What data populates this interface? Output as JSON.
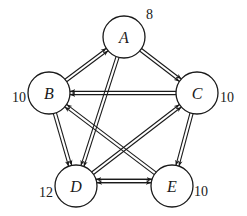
{
  "diagram": {
    "type": "directed-graph",
    "colors": {
      "stroke": "#1a1a1a",
      "background": "#ffffff"
    },
    "nodes": [
      {
        "id": "A",
        "label": "A",
        "weight": "8",
        "cx": 124,
        "cy": 37,
        "r": 21,
        "wx": 146,
        "wy": 14,
        "anchor": "start"
      },
      {
        "id": "B",
        "label": "B",
        "weight": "10",
        "cx": 49,
        "cy": 93,
        "r": 21,
        "wx": 26,
        "wy": 97,
        "anchor": "end"
      },
      {
        "id": "C",
        "label": "C",
        "weight": "10",
        "cx": 197,
        "cy": 93,
        "r": 21,
        "wx": 220,
        "wy": 97,
        "anchor": "start"
      },
      {
        "id": "D",
        "label": "D",
        "weight": "12",
        "cx": 76,
        "cy": 186,
        "r": 21,
        "wx": 53,
        "wy": 192,
        "anchor": "end"
      },
      {
        "id": "E",
        "label": "E",
        "weight": "10",
        "cx": 172,
        "cy": 186,
        "r": 21,
        "wx": 194,
        "wy": 191,
        "anchor": "start"
      }
    ],
    "edges": [
      {
        "from": "B",
        "to": "A",
        "offset": 0
      },
      {
        "from": "A",
        "to": "C",
        "offset": 0
      },
      {
        "from": "C",
        "to": "B",
        "offset": 0
      },
      {
        "from": "A",
        "to": "D",
        "offset": 0
      },
      {
        "from": "B",
        "to": "D",
        "offset": 0
      },
      {
        "from": "D",
        "to": "C",
        "offset": 0
      },
      {
        "from": "E",
        "to": "B",
        "offset": 0
      },
      {
        "from": "C",
        "to": "E",
        "offset": 0
      },
      {
        "from": "D",
        "to": "E",
        "offset": -5
      },
      {
        "from": "E",
        "to": "D",
        "offset": 5
      }
    ]
  }
}
